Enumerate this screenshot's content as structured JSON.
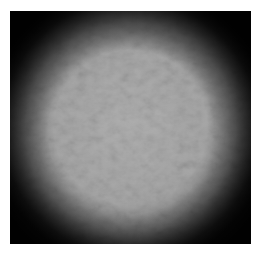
{
  "image": {
    "description": "Grayscale micrograph-like textured field with dark circular vignette",
    "colors": {
      "background": "#ffffff",
      "dark_edge": "#0c0c0c",
      "center_gray": "#afafaf"
    }
  }
}
